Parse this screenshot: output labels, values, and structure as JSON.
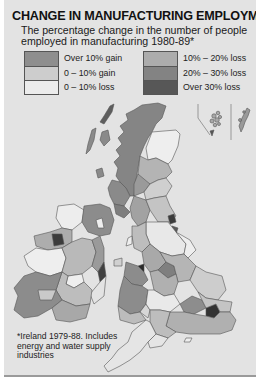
{
  "title": "CHANGE IN MANUFACTURING EMPLOYMENT",
  "subtitle": "The percentage change in the number of people employed in manufacturing 1980-89*",
  "legend": {
    "left": [
      {
        "label": "Over 10% gain",
        "color": "#8e8e8e"
      },
      {
        "label": "0 – 10% gain",
        "color": "#cdcdcd"
      },
      {
        "label": "0 – 10% loss",
        "color": "#ececec"
      }
    ],
    "right": [
      {
        "label": "10% – 20% loss",
        "color": "#acacac"
      },
      {
        "label": "20% – 30% loss",
        "color": "#838383"
      },
      {
        "label": "Over 30% loss",
        "color": "#575757"
      }
    ]
  },
  "footnote": "*Ireland 1979-88. Includes energy and water supply industries",
  "map": {
    "regions": [
      "Scotland",
      "Northern England",
      "Wales",
      "Midlands",
      "South England",
      "Ireland",
      "Northern Ireland",
      "Orkney",
      "Shetland"
    ],
    "background_color": "#e3e3e3",
    "outline_color": "#5a5a5a"
  }
}
